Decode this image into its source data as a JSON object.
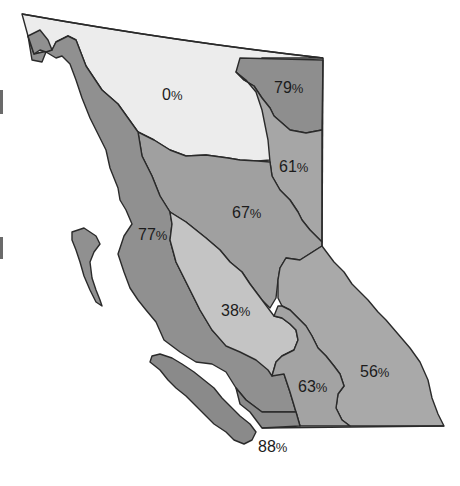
{
  "map": {
    "type": "choropleth",
    "subject": "British Columbia regions",
    "legend_note": "",
    "regions": [
      {
        "id": "north",
        "label": "0%",
        "value": 0,
        "color": "#ececec"
      },
      {
        "id": "northeast",
        "label": "79%",
        "value": 79,
        "color": "#8e8e8e"
      },
      {
        "id": "peace",
        "label": "61%",
        "value": 61,
        "color": "#a6a6a6"
      },
      {
        "id": "central-north",
        "label": "67%",
        "value": 67,
        "color": "#a0a0a0"
      },
      {
        "id": "coast",
        "label": "77%",
        "value": 77,
        "color": "#909090"
      },
      {
        "id": "cariboo",
        "label": "38%",
        "value": 38,
        "color": "#c4c4c4"
      },
      {
        "id": "kootenay",
        "label": "56%",
        "value": 56,
        "color": "#a9a9a9"
      },
      {
        "id": "okanagan",
        "label": "63%",
        "value": 63,
        "color": "#a3a3a3"
      },
      {
        "id": "island",
        "label": "88%",
        "value": 88,
        "color": "#8a8a8a"
      }
    ]
  },
  "colors": {
    "background": "#ffffff",
    "outline": "#2a2a2a",
    "text": "#1c1c1c"
  }
}
